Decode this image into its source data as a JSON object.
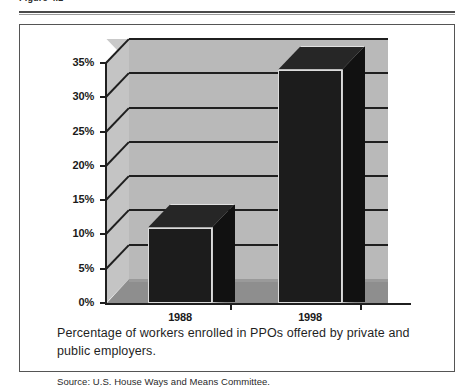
{
  "figure": {
    "header_label": "Figure 4.2",
    "caption": "Percentage of workers enrolled in PPOs offered by private and public employers.",
    "source": "Source:  U.S. House Ways and Means Committee."
  },
  "chart_data": {
    "type": "bar",
    "title": "",
    "subtitle": "",
    "xlabel": "",
    "ylabel": "",
    "categories": [
      "1988",
      "1998"
    ],
    "values": [
      11,
      34
    ],
    "tick_labels": [
      "0%",
      "5%",
      "10%",
      "15%",
      "20%",
      "25%",
      "30%",
      "35%"
    ],
    "tick_values": [
      0,
      5,
      10,
      15,
      20,
      25,
      30,
      35
    ],
    "ylim": [
      0,
      35
    ],
    "grid": true,
    "legend": false,
    "legend_position": "none",
    "style": "3d-bar",
    "bar_color": "#1c1c1c",
    "wall_color": "#b9b9b9",
    "floor_color": "#8e8e8e",
    "annotations": []
  }
}
